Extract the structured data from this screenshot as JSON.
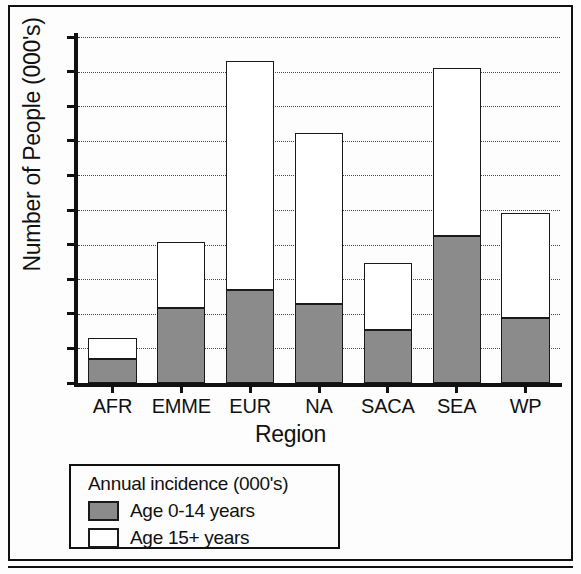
{
  "chart_data": {
    "type": "bar",
    "subtype": "stacked-bar",
    "title": "",
    "xlabel": "Region",
    "ylabel": "Number of People (000's)",
    "categories": [
      "AFR",
      "EMME",
      "EUR",
      "NA",
      "SACA",
      "SEA",
      "WP"
    ],
    "series": [
      {
        "name": "Age 0-14 years",
        "color": "#8b8b8b",
        "values": [
          3.5,
          10.8,
          13.4,
          11.4,
          7.7,
          21.3,
          9.4
        ]
      },
      {
        "name": "Age 15+ years",
        "color": "#ffffff",
        "values": [
          3.0,
          9.6,
          33.1,
          24.7,
          9.7,
          24.2,
          15.1
        ]
      }
    ],
    "totals": [
      6.5,
      20.4,
      46.5,
      36.1,
      17.4,
      45.5,
      24.5
    ],
    "ylim": [
      0,
      50
    ],
    "ytick_values": [
      0,
      5,
      10,
      15,
      20,
      25,
      30,
      35,
      40,
      45,
      50
    ],
    "ytick_labels": [
      "0",
      "5",
      "10",
      "15",
      "20",
      "25",
      "30",
      "35",
      "40",
      "45",
      "50"
    ],
    "grid": true,
    "grid_axis": "y",
    "grid_style": "dotted",
    "legend_position": "below-plot-left",
    "legend": {
      "title": "Annual incidence (000's)",
      "entries": [
        {
          "label": "Age 0-14 years",
          "swatch": "gray"
        },
        {
          "label": "Age 15+ years",
          "swatch": "white"
        }
      ]
    }
  }
}
